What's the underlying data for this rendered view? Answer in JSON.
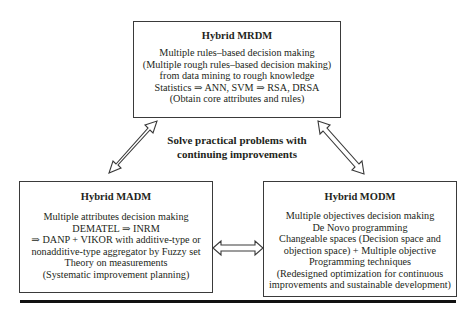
{
  "diagram": {
    "center_label": {
      "lines": [
        "Solve practical problems with",
        "continuing improvements"
      ]
    },
    "boxes": {
      "mrdm": {
        "title": "Hybrid MRDM",
        "lines": [
          "Multiple rules–based decision making",
          "(Multiple rough rules–based decision making)",
          "from data mining to rough knowledge",
          "Statistics ⇒ ANN, SVM ⇒ RSA, DRSA",
          "(Obtain core attributes and rules)"
        ]
      },
      "madm": {
        "title": "Hybrid MADM",
        "lines": [
          "Multiple attributes decision making",
          "DEMATEL ⇒ INRM",
          "⇒ DANP + VIKOR with additive-type or",
          "nonadditive-type aggregator by Fuzzy set",
          "Theory on measurements",
          "(Systematic improvement planning)"
        ]
      },
      "modm": {
        "title": "Hybrid MODM",
        "lines": [
          "Multiple objectives decision making",
          "De Novo programming",
          "Changeable spaces (Decision space and",
          "objection space) + Multiple objective",
          "Programming techniques",
          "(Redesigned optimization for continuous",
          "improvements and sustainable development)"
        ]
      }
    },
    "connectors": [
      {
        "from": "mrdm",
        "to": "madm",
        "type": "double-arrow"
      },
      {
        "from": "mrdm",
        "to": "modm",
        "type": "double-arrow"
      },
      {
        "from": "madm",
        "to": "modm",
        "type": "double-arrow"
      }
    ],
    "colors": {
      "stroke": "#3a3a3a",
      "text": "#231f20",
      "background": "#ffffff"
    }
  }
}
